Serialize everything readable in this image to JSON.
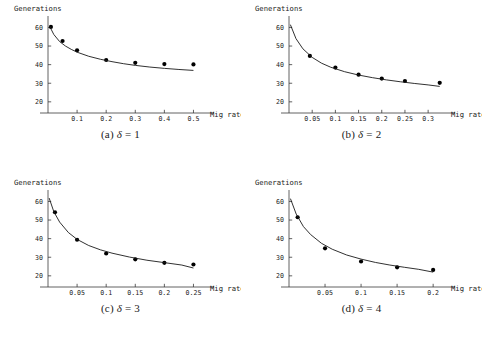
{
  "figure": {
    "background": "#ffffff",
    "point_color": "#000000",
    "curve_color": "#1a1a1a",
    "axis_color": "#3a3a3a"
  },
  "subplots": [
    {
      "key": "a",
      "caption_index": "(a)",
      "caption_symbol": "δ",
      "caption_equals": "=",
      "caption_value": "1",
      "chart_data": {
        "type": "scatter",
        "title": "",
        "xlabel": "Mig rate",
        "ylabel": "Generations",
        "xlim": [
          0,
          0.55
        ],
        "ylim": [
          14,
          64
        ],
        "xticks": [
          0.1,
          0.2,
          0.3,
          0.4,
          0.5
        ],
        "xticklabels": [
          "0.1",
          "0.2",
          "0.3",
          "0.4",
          "0.5"
        ],
        "yticks": [
          20,
          30,
          40,
          50,
          60
        ],
        "yticklabels": [
          "20",
          "30",
          "40",
          "50",
          "60"
        ],
        "grid": false,
        "legend": "none",
        "series": [
          {
            "name": "observed",
            "type": "scatter",
            "x": [
              0.01,
              0.05,
              0.1,
              0.2,
              0.3,
              0.4,
              0.5
            ],
            "y": [
              60.3,
              52.7,
              47.7,
              42.5,
              41.0,
              40.3,
              40.1
            ]
          },
          {
            "name": "fitted curve",
            "type": "line",
            "x": [
              0.005,
              0.02,
              0.04,
              0.06,
              0.08,
              0.1,
              0.14,
              0.18,
              0.22,
              0.26,
              0.3,
              0.35,
              0.4,
              0.45,
              0.5
            ],
            "y": [
              60.8,
              56.2,
              52.4,
              50.0,
              48.2,
              46.7,
              44.5,
              42.9,
              41.6,
              40.5,
              39.6,
              38.7,
              38.0,
              37.4,
              36.9
            ]
          }
        ]
      }
    },
    {
      "key": "b",
      "caption_index": "(b)",
      "caption_symbol": "δ",
      "caption_equals": "=",
      "caption_value": "2",
      "chart_data": {
        "type": "scatter",
        "title": "",
        "xlabel": "Mig rate",
        "ylabel": "Generations",
        "xlim": [
          0,
          0.345
        ],
        "ylim": [
          14,
          64
        ],
        "xticks": [
          0.05,
          0.1,
          0.15,
          0.2,
          0.25,
          0.3
        ],
        "xticklabels": [
          "0.05",
          "0.1",
          "0.15",
          "0.2",
          "0.25",
          "0.3"
        ],
        "yticks": [
          20,
          30,
          40,
          50,
          60
        ],
        "yticklabels": [
          "20",
          "30",
          "40",
          "50",
          "60"
        ],
        "grid": false,
        "legend": "none",
        "series": [
          {
            "name": "observed",
            "type": "scatter",
            "x": [
              0.045,
              0.1,
              0.15,
              0.2,
              0.25,
              0.325
            ],
            "y": [
              44.7,
              38.4,
              34.6,
              32.5,
              31.2,
              30.2
            ]
          },
          {
            "name": "fitted curve",
            "type": "line",
            "x": [
              0.003,
              0.015,
              0.03,
              0.05,
              0.07,
              0.09,
              0.12,
              0.15,
              0.18,
              0.21,
              0.24,
              0.27,
              0.3,
              0.325
            ],
            "y": [
              61.5,
              54.0,
              48.5,
              43.9,
              40.8,
              38.6,
              36.2,
              34.4,
              33.0,
              31.8,
              30.8,
              29.9,
              29.1,
              28.3
            ]
          }
        ]
      }
    },
    {
      "key": "c",
      "caption_index": "(c)",
      "caption_symbol": "δ",
      "caption_equals": "=",
      "caption_value": "3",
      "chart_data": {
        "type": "scatter",
        "title": "",
        "xlabel": "Mig rate",
        "ylabel": "Generations",
        "xlim": [
          0,
          0.275
        ],
        "ylim": [
          14,
          64
        ],
        "xticks": [
          0.05,
          0.1,
          0.15,
          0.2,
          0.25
        ],
        "xticklabels": [
          "0.05",
          "0.1",
          "0.15",
          "0.2",
          "0.25"
        ],
        "yticks": [
          20,
          30,
          40,
          50,
          60
        ],
        "yticklabels": [
          "20",
          "30",
          "40",
          "50",
          "60"
        ],
        "grid": false,
        "legend": "none",
        "series": [
          {
            "name": "observed",
            "type": "scatter",
            "x": [
              0.012,
              0.05,
              0.1,
              0.15,
              0.2,
              0.25
            ],
            "y": [
              54.2,
              39.4,
              32.0,
              28.9,
              27.0,
              26.1
            ]
          },
          {
            "name": "fitted curve",
            "type": "line",
            "x": [
              0.002,
              0.01,
              0.02,
              0.035,
              0.05,
              0.07,
              0.09,
              0.11,
              0.14,
              0.17,
              0.2,
              0.23,
              0.25
            ],
            "y": [
              61.8,
              54.5,
              48.9,
              43.3,
              39.6,
              36.3,
              34.0,
              32.2,
              30.1,
              28.4,
              27.1,
              25.8,
              24.2
            ]
          }
        ]
      }
    },
    {
      "key": "d",
      "caption_index": "(d)",
      "caption_symbol": "δ",
      "caption_equals": "=",
      "caption_value": "4",
      "chart_data": {
        "type": "scatter",
        "title": "",
        "xlabel": "Mig rate",
        "ylabel": "Generations",
        "xlim": [
          0,
          0.222
        ],
        "ylim": [
          14,
          64
        ],
        "xticks": [
          0.05,
          0.1,
          0.15,
          0.2
        ],
        "xticklabels": [
          "0.05",
          "0.1",
          "0.15",
          "0.2"
        ],
        "yticks": [
          20,
          30,
          40,
          50,
          60
        ],
        "yticklabels": [
          "20",
          "30",
          "40",
          "50",
          "60"
        ],
        "grid": false,
        "legend": "none",
        "series": [
          {
            "name": "observed",
            "type": "scatter",
            "x": [
              0.012,
              0.05,
              0.1,
              0.15,
              0.2
            ],
            "y": [
              51.5,
              34.8,
              27.7,
              24.6,
              23.2
            ]
          },
          {
            "name": "fitted curve",
            "type": "line",
            "x": [
              0.002,
              0.01,
              0.02,
              0.03,
              0.045,
              0.06,
              0.08,
              0.1,
              0.12,
              0.14,
              0.16,
              0.18,
              0.2
            ],
            "y": [
              61.5,
              53.2,
              46.5,
              42.2,
              37.5,
              34.3,
              31.2,
              29.0,
              27.2,
              25.8,
              24.6,
              23.5,
              22.0
            ]
          }
        ]
      }
    }
  ]
}
